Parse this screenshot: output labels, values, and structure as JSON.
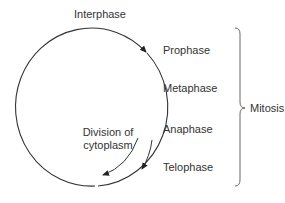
{
  "diagram": {
    "cycle_label": "Interphase",
    "phases": [
      "Prophase",
      "Metaphase",
      "Anaphase",
      "Telophase"
    ],
    "group_label": "Mitosis",
    "inner_label_line1": "Division of",
    "inner_label_line2": "cytoplasm",
    "colors": {
      "line": "#333333",
      "text": "#333333",
      "brace": "#666666"
    }
  }
}
